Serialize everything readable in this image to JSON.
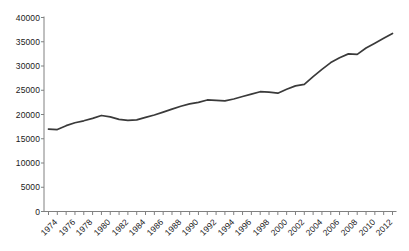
{
  "chart_data": {
    "type": "line",
    "title": "",
    "subtitle": "",
    "xlabel": "",
    "ylabel": "",
    "xlim": [
      1974,
      2013
    ],
    "ylim": [
      0,
      40000
    ],
    "grid": false,
    "legend": "none",
    "line_color": "#3a3a3a",
    "axis_color": "#808080",
    "text_color": "#1a1a1a",
    "background": "#ffffff",
    "y_ticks": [
      0,
      5000,
      10000,
      15000,
      20000,
      25000,
      30000,
      35000,
      40000
    ],
    "y_tick_labels": [
      "0",
      "5000",
      "10000",
      "15000",
      "20000",
      "25000",
      "30000",
      "35000",
      "40000"
    ],
    "x_tick_labels": [
      "1974",
      "1976",
      "1978",
      "1980",
      "1982",
      "1984",
      "1986",
      "1988",
      "1990",
      "1992",
      "1994",
      "1996",
      "1998",
      "2000",
      "2002",
      "2004",
      "2006",
      "2008",
      "2010",
      "2012"
    ],
    "x_minor_ticks_every": 1,
    "x": [
      1974,
      1975,
      1976,
      1977,
      1978,
      1979,
      1980,
      1981,
      1982,
      1983,
      1984,
      1985,
      1986,
      1987,
      1988,
      1989,
      1990,
      1991,
      1992,
      1993,
      1994,
      1995,
      1996,
      1997,
      1998,
      1999,
      2000,
      2001,
      2002,
      2003,
      2004,
      2005,
      2006,
      2007,
      2008,
      2009,
      2010,
      2011,
      2012,
      2013
    ],
    "values": [
      17000,
      16900,
      17700,
      18300,
      18700,
      19200,
      19800,
      19500,
      19000,
      18800,
      18900,
      19400,
      19900,
      20500,
      21100,
      21700,
      22200,
      22500,
      23000,
      22900,
      22800,
      23200,
      23700,
      24200,
      24700,
      24600,
      24400,
      25200,
      25900,
      26200,
      27800,
      29300,
      30700,
      31700,
      32500,
      32400,
      33700,
      34700,
      35700,
      36700
    ]
  }
}
